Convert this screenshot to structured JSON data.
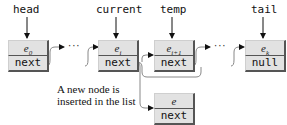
{
  "pointers": {
    "head": "head",
    "current": "current",
    "temp": "temp",
    "tail": "tail"
  },
  "nodes": [
    {
      "id": "e0",
      "element": "e",
      "subscript": "0",
      "next": "next"
    },
    {
      "id": "ei",
      "element": "e",
      "subscript": "i",
      "next": "next"
    },
    {
      "id": "ei1",
      "element": "e",
      "subscript": "i+1",
      "next": "next"
    },
    {
      "id": "ek",
      "element": "e",
      "subscript": "k",
      "next": "null"
    },
    {
      "id": "e",
      "element": "e",
      "subscript": "",
      "next": "next"
    }
  ],
  "ellipsis": "···",
  "caption": "A new node is inserted in the list"
}
